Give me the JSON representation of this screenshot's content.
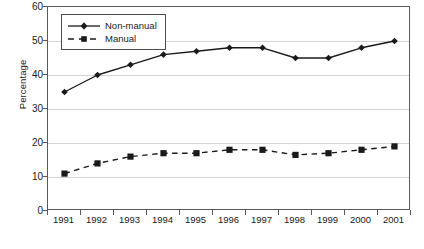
{
  "chart_data": {
    "type": "line",
    "title": "",
    "xlabel": "",
    "ylabel": "Percentage",
    "categories": [
      "1991",
      "1992",
      "1993",
      "1994",
      "1995",
      "1996",
      "1997",
      "1998",
      "1999",
      "2000",
      "2001"
    ],
    "ylim": [
      0,
      60
    ],
    "ytick_labels": [
      "0",
      "10",
      "20",
      "30",
      "40",
      "50",
      "60"
    ],
    "ytick_values": [
      0,
      10,
      20,
      30,
      40,
      50,
      60
    ],
    "grid": "horizontal",
    "legend_position": "top-left-inside",
    "series": [
      {
        "name": "Non-manual",
        "values": [
          35,
          40,
          43,
          46,
          47,
          48,
          48,
          45,
          45,
          48,
          50
        ],
        "line_style": "solid",
        "marker": "diamond",
        "color": "#1a1a1a"
      },
      {
        "name": "Manual",
        "values": [
          11,
          14,
          16,
          17,
          17,
          18,
          18,
          16.5,
          17,
          18,
          19
        ],
        "line_style": "dashed",
        "marker": "square",
        "color": "#1a1a1a"
      }
    ]
  },
  "legend": {
    "items": [
      {
        "label": "Non-manual"
      },
      {
        "label": "Manual"
      }
    ]
  },
  "caption": {
    "text": ""
  }
}
